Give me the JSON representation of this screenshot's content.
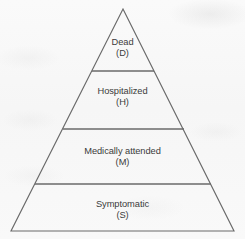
{
  "diagram": {
    "type": "pyramid",
    "name": "burden-of-illness-pyramid",
    "geometry": {
      "apex": [
        123,
        9
      ],
      "base_left": [
        11,
        231
      ],
      "base_right": [
        234,
        231
      ],
      "dividers_y": [
        71,
        129,
        184
      ]
    },
    "style": {
      "line_color": "#6a6a6a",
      "text_color": "#3b3b3b",
      "background_color": "#f8f8f8",
      "fill_color": "none"
    },
    "tiers": [
      {
        "id": "dead",
        "label": "Dead",
        "code": "(D)",
        "level": 1
      },
      {
        "id": "hospitalized",
        "label": "Hospitalized",
        "code": "(H)",
        "level": 2
      },
      {
        "id": "medically",
        "label": "Medically attended",
        "code": "(M)",
        "level": 3
      },
      {
        "id": "symptomatic",
        "label": "Symptomatic",
        "code": "(S)",
        "level": 4
      }
    ]
  }
}
